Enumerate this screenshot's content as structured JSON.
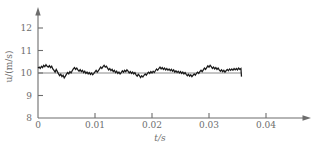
{
  "chart_data": {
    "type": "line",
    "title": "",
    "xlabel": "t/s",
    "ylabel": "u/(m/s)",
    "xlim": [
      0,
      0.0472
    ],
    "ylim": [
      8,
      12.6
    ],
    "xticks": [
      0,
      0.01,
      0.02,
      0.03,
      0.04
    ],
    "xtick_labels": [
      "0",
      "0.01",
      "0.02",
      "0.03",
      "0.04"
    ],
    "yticks": [
      8,
      9,
      10,
      11,
      12
    ],
    "ytick_labels": [
      "8",
      "9",
      "10",
      "11",
      "12"
    ],
    "grid": false,
    "legend": null,
    "axis_arrows": true,
    "reference_line": {
      "orientation": "horizontal",
      "value": 10,
      "x_start": 0,
      "x_end": 0.0357
    },
    "series": [
      {
        "name": "instantaneous velocity",
        "color": "#1a1a1a",
        "mean": 10.0,
        "x_start": 0,
        "x_end": 0.0357,
        "x": [
          0.0,
          0.0002,
          0.0004,
          0.0006,
          0.0008,
          0.001,
          0.0012,
          0.0014,
          0.0016,
          0.0018,
          0.002,
          0.0022,
          0.0024,
          0.0026,
          0.0028,
          0.003,
          0.0032,
          0.0034,
          0.0036,
          0.0038,
          0.004,
          0.0042,
          0.0044,
          0.0046,
          0.0048,
          0.005,
          0.0052,
          0.0054,
          0.0056,
          0.0058,
          0.006,
          0.0062,
          0.0064,
          0.0066,
          0.0068,
          0.007,
          0.0072,
          0.0074,
          0.0076,
          0.0078,
          0.008,
          0.0082,
          0.0084,
          0.0086,
          0.0088,
          0.009,
          0.0092,
          0.0094,
          0.0096,
          0.0098,
          0.01,
          0.0102,
          0.0104,
          0.0106,
          0.0108,
          0.011,
          0.0112,
          0.0114,
          0.0116,
          0.0118,
          0.012,
          0.0122,
          0.0124,
          0.0126,
          0.0128,
          0.013,
          0.0132,
          0.0134,
          0.0136,
          0.0138,
          0.014,
          0.0142,
          0.0144,
          0.0146,
          0.0148,
          0.015,
          0.0152,
          0.0154,
          0.0156,
          0.0158,
          0.016,
          0.0162,
          0.0164,
          0.0166,
          0.0168,
          0.017,
          0.0172,
          0.0174,
          0.0176,
          0.0178,
          0.018,
          0.0182,
          0.0184,
          0.0186,
          0.0188,
          0.019,
          0.0192,
          0.0194,
          0.0196,
          0.0198,
          0.02,
          0.0202,
          0.0204,
          0.0206,
          0.0208,
          0.021,
          0.0212,
          0.0214,
          0.0216,
          0.0218,
          0.022,
          0.0222,
          0.0224,
          0.0226,
          0.0228,
          0.023,
          0.0232,
          0.0234,
          0.0236,
          0.0238,
          0.024,
          0.0242,
          0.0244,
          0.0246,
          0.0248,
          0.025,
          0.0252,
          0.0254,
          0.0256,
          0.0258,
          0.026,
          0.0262,
          0.0264,
          0.0266,
          0.0268,
          0.027,
          0.0272,
          0.0274,
          0.0276,
          0.0278,
          0.028,
          0.0282,
          0.0284,
          0.0286,
          0.0288,
          0.029,
          0.0292,
          0.0294,
          0.0296,
          0.0298,
          0.03,
          0.0302,
          0.0304,
          0.0306,
          0.0308,
          0.031,
          0.0312,
          0.0314,
          0.0316,
          0.0318,
          0.032,
          0.0322,
          0.0324,
          0.0326,
          0.0328,
          0.033,
          0.0332,
          0.0334,
          0.0336,
          0.0338,
          0.034,
          0.0342,
          0.0344,
          0.0346,
          0.0348,
          0.035,
          0.0352,
          0.0354,
          0.0356,
          0.0357
        ],
        "y": [
          10.22,
          10.26,
          10.2,
          10.3,
          10.24,
          10.34,
          10.28,
          10.37,
          10.3,
          10.26,
          10.33,
          10.24,
          10.3,
          10.18,
          10.12,
          10.04,
          10.16,
          10.06,
          9.96,
          9.88,
          9.95,
          9.84,
          9.9,
          9.78,
          9.86,
          9.95,
          10.02,
          9.96,
          10.06,
          10.0,
          10.1,
          10.18,
          10.24,
          10.16,
          10.22,
          10.14,
          10.08,
          10.15,
          10.06,
          10.12,
          10.02,
          10.08,
          9.98,
          10.04,
          9.96,
          10.02,
          9.94,
          10.0,
          9.92,
          9.98,
          10.05,
          10.12,
          10.04,
          10.1,
          10.18,
          10.26,
          10.2,
          10.28,
          10.34,
          10.26,
          10.3,
          10.22,
          10.14,
          10.2,
          10.1,
          10.16,
          10.06,
          10.12,
          10.02,
          10.08,
          9.98,
          10.04,
          9.96,
          10.02,
          10.1,
          10.04,
          10.12,
          10.06,
          10.14,
          10.08,
          10.0,
          10.06,
          9.98,
          10.04,
          9.96,
          10.02,
          9.92,
          9.86,
          9.94,
          9.88,
          9.8,
          9.88,
          9.82,
          9.9,
          9.96,
          9.9,
          9.98,
          10.04,
          9.98,
          10.06,
          10.0,
          10.08,
          10.02,
          10.1,
          10.18,
          10.12,
          10.2,
          10.26,
          10.18,
          10.24,
          10.16,
          10.22,
          10.14,
          10.2,
          10.12,
          10.18,
          10.1,
          10.16,
          10.08,
          10.14,
          10.04,
          10.1,
          10.02,
          10.08,
          10.0,
          10.06,
          9.98,
          10.04,
          9.96,
          10.02,
          9.94,
          9.88,
          9.94,
          9.86,
          9.92,
          9.84,
          9.9,
          9.96,
          9.9,
          9.98,
          10.04,
          9.98,
          10.06,
          10.12,
          10.06,
          10.14,
          10.22,
          10.16,
          10.24,
          10.32,
          10.26,
          10.34,
          10.28,
          10.2,
          10.26,
          10.18,
          10.24,
          10.16,
          10.22,
          10.14,
          10.08,
          10.14,
          10.06,
          10.12,
          10.04,
          10.1,
          10.16,
          10.1,
          10.18,
          10.12,
          10.18,
          10.12,
          10.2,
          10.14,
          10.2,
          10.14,
          10.22,
          10.16,
          10.2,
          9.84
        ]
      }
    ]
  },
  "figure": {
    "background_color": "#ffffff",
    "axis_color": "#6d6d6d",
    "line_color": "#1a1a1a"
  }
}
